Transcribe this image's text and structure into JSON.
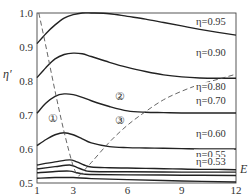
{
  "chart_data": {
    "type": "line",
    "title": "",
    "xlabel": "E",
    "ylabel": "η′",
    "xlim": [
      1,
      12
    ],
    "ylim": [
      0.5,
      1.0
    ],
    "xticks": [
      1,
      3,
      6,
      9,
      12
    ],
    "yticks": [
      0.5,
      0.6,
      0.7,
      0.8,
      0.9,
      1.0
    ],
    "grid": false,
    "legend": "inline labels at right",
    "series": [
      {
        "name": "η=0.95",
        "style": "solid",
        "x": [
          1,
          1.5,
          2,
          2.5,
          3,
          3.5,
          4,
          5,
          6,
          7,
          8,
          9,
          10,
          11,
          12
        ],
        "y": [
          0.91,
          0.94,
          0.965,
          0.985,
          0.995,
          1.0,
          1.0,
          0.998,
          0.99,
          0.982,
          0.972,
          0.962,
          0.952,
          0.943,
          0.935
        ]
      },
      {
        "name": "η=0.90",
        "style": "solid",
        "x": [
          1,
          1.5,
          2,
          2.5,
          3,
          3.5,
          4,
          5,
          6,
          7,
          8,
          9,
          10,
          11,
          12
        ],
        "y": [
          0.81,
          0.84,
          0.865,
          0.878,
          0.882,
          0.88,
          0.872,
          0.855,
          0.84,
          0.828,
          0.818,
          0.812,
          0.809,
          0.808,
          0.808
        ]
      },
      {
        "name": "η=0.80",
        "style": "solid",
        "x": [
          1,
          1.5,
          2,
          2.5,
          3,
          3.5,
          4,
          5,
          6,
          7,
          8,
          9,
          10,
          11,
          12
        ],
        "y": [
          0.705,
          0.735,
          0.755,
          0.762,
          0.76,
          0.752,
          0.742,
          0.725,
          0.712,
          0.708,
          0.707,
          0.706,
          0.706,
          0.706,
          0.706
        ]
      },
      {
        "name": "η=0.70",
        "style": "solid",
        "x": [
          1,
          1.5,
          2,
          2.5,
          3,
          3.5,
          4,
          5,
          6,
          7,
          8,
          9,
          10,
          11,
          12
        ],
        "y": [
          0.61,
          0.628,
          0.642,
          0.648,
          0.642,
          0.63,
          0.618,
          0.607,
          0.604,
          0.603,
          0.602,
          0.601,
          0.6,
          0.6,
          0.6
        ]
      },
      {
        "name": "η=0.60",
        "style": "solid",
        "x": [
          1,
          2,
          2.8,
          3.2,
          3.6,
          4,
          5,
          6,
          7,
          8,
          9,
          10,
          11,
          12
        ],
        "y": [
          0.553,
          0.562,
          0.568,
          0.562,
          0.553,
          0.547,
          0.545,
          0.544,
          0.543,
          0.542,
          0.541,
          0.54,
          0.54,
          0.539
        ]
      },
      {
        "name": "η=0.55",
        "style": "solid",
        "x": [
          1,
          2,
          2.8,
          3.2,
          3.6,
          4,
          6,
          9,
          12
        ],
        "y": [
          0.541,
          0.548,
          0.553,
          0.546,
          0.538,
          0.534,
          0.533,
          0.532,
          0.532
        ]
      },
      {
        "name": "η=0.53",
        "style": "solid",
        "x": [
          1,
          2,
          2.8,
          3.2,
          3.6,
          4,
          6,
          9,
          12
        ],
        "y": [
          0.53,
          0.534,
          0.535,
          0.53,
          0.526,
          0.525,
          0.524,
          0.523,
          0.522
        ]
      },
      {
        "name": "η=0.50",
        "style": "solid",
        "x": [
          1,
          2,
          3,
          4,
          6,
          9,
          12
        ],
        "y": [
          0.514,
          0.516,
          0.516,
          0.513,
          0.51,
          0.506,
          0.503
        ]
      },
      {
        "name": "boundary-1",
        "style": "dashed",
        "x": [
          1.1,
          1.5,
          2,
          2.5,
          3,
          3.3
        ],
        "y": [
          1.0,
          0.9,
          0.77,
          0.65,
          0.55,
          0.52
        ]
      },
      {
        "name": "boundary-2",
        "style": "dashed",
        "x": [
          3.3,
          4,
          5,
          6,
          7,
          8,
          9,
          10,
          11,
          12
        ],
        "y": [
          0.52,
          0.56,
          0.62,
          0.67,
          0.71,
          0.745,
          0.77,
          0.79,
          0.805,
          0.82
        ]
      }
    ],
    "annotations": [
      {
        "text": "①",
        "x": 1.9,
        "y": 0.68
      },
      {
        "text": "②",
        "x": 5.6,
        "y": 0.745
      },
      {
        "text": "③",
        "x": 5.6,
        "y": 0.675
      }
    ],
    "line_labels": [
      {
        "text": "η=0.95",
        "y": 0.965
      },
      {
        "text": "η=0.90",
        "y": 0.875
      },
      {
        "text": "η=0.80",
        "y": 0.773
      },
      {
        "text": "η=0.70",
        "y": 0.733
      },
      {
        "text": "η=0.60",
        "y": 0.635
      },
      {
        "text": "η=0.55",
        "y": 0.575
      },
      {
        "text": "η=0.53",
        "y": 0.553
      }
    ]
  },
  "axis": {
    "ylabel": "η′",
    "xlabel": "E"
  }
}
